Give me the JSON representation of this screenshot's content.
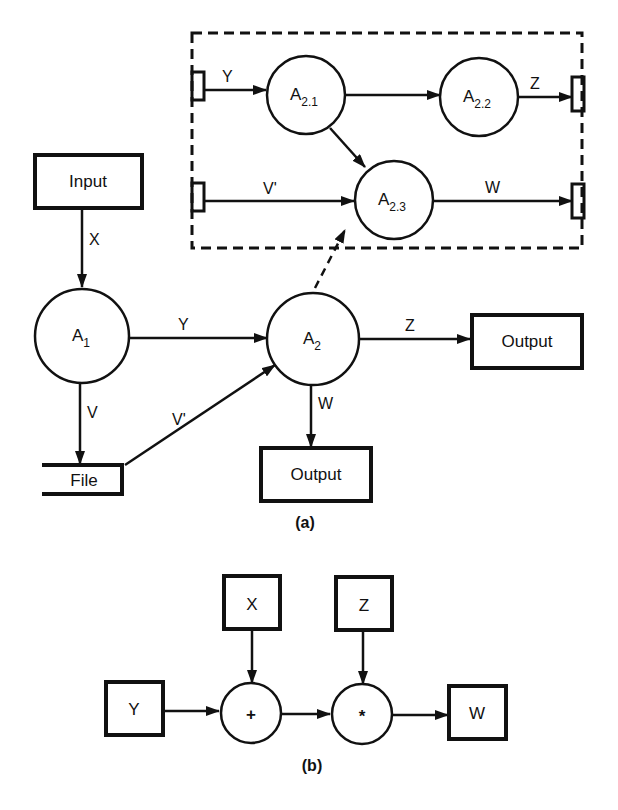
{
  "figure_a": {
    "caption": "(a)",
    "nodes": {
      "input": "Input",
      "a1": {
        "base": "A",
        "sub": "1"
      },
      "a2": {
        "base": "A",
        "sub": "2"
      },
      "file": "File",
      "output_right": "Output",
      "output_bottom": "Output"
    },
    "edges": {
      "input_a1": "X",
      "a1_a2": "Y",
      "a1_file": "V",
      "file_a2": "V'",
      "a2_output_right": "Z",
      "a2_output_bottom": "W"
    },
    "expansion": {
      "nodes": {
        "a21": {
          "base": "A",
          "sub": "2.1"
        },
        "a22": {
          "base": "A",
          "sub": "2.2"
        },
        "a23": {
          "base": "A",
          "sub": "2.3"
        }
      },
      "edges": {
        "in_y": "Y",
        "in_v": "V'",
        "out_z": "Z",
        "out_w": "W"
      }
    }
  },
  "figure_b": {
    "caption": "(b)",
    "nodes": {
      "x": "X",
      "z": "Z",
      "y": "Y",
      "w": "W",
      "plus": "+",
      "times": "*"
    }
  },
  "colors": {
    "ink": "#111111",
    "paper": "#ffffff"
  }
}
